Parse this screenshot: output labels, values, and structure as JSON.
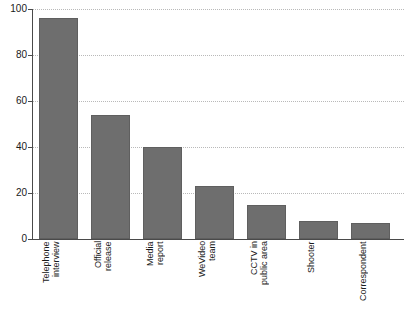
{
  "chart_data": {
    "type": "bar",
    "title": "",
    "xlabel": "",
    "ylabel": "",
    "ylim": [
      0,
      100
    ],
    "ytick_values": [
      0,
      20,
      40,
      60,
      80,
      100
    ],
    "ytick_labels": [
      "0",
      "20",
      "40",
      "60",
      "80",
      "100"
    ],
    "grid": true,
    "legend": "none",
    "orientation": "vertical",
    "bar_color": "#6e6e6e",
    "axis_color": "#4a4a4a",
    "gridline_color": "#b9b9b9",
    "background_color": "#ffffff",
    "categories": [
      "Telephone\ninterview",
      "Official\nrelease",
      "Media\nreport",
      "WeVideo\nteam",
      "CCTV in\npublic area",
      "Shooter",
      "Correspondent"
    ],
    "values": [
      96,
      54,
      40,
      23,
      15,
      8,
      7
    ]
  }
}
